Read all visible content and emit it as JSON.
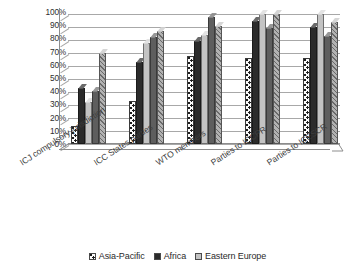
{
  "chart_data": {
    "type": "bar",
    "title": "",
    "subtitle": "",
    "xlabel": "",
    "ylabel": "",
    "ylim": [
      0,
      100
    ],
    "grid": true,
    "legend_position": "bottom",
    "y_ticks": [
      "0%",
      "10%",
      "20%",
      "30%",
      "40%",
      "50%",
      "60%",
      "70%",
      "80%",
      "90%",
      "100%"
    ],
    "y_tick_values": [
      0,
      10,
      20,
      30,
      40,
      50,
      60,
      70,
      80,
      90,
      100
    ],
    "categories": [
      "ICJ compulsory jurisdiction",
      "ICC States parties",
      "WTO members",
      "Parties to ICCPR",
      "Parties to ICESCR"
    ],
    "series": [
      {
        "name": "Asia-Pacific",
        "pattern": "dotted",
        "color": "#fbfbfb",
        "values": [
          14,
          33,
          68,
          66,
          66
        ]
      },
      {
        "name": "Africa",
        "pattern": "solid-dark",
        "color": "#2b2b2b",
        "values": [
          43,
          63,
          79,
          95,
          90
        ]
      },
      {
        "name": "Eastern Europe",
        "pattern": "solid-light",
        "color": "#c3c3c3",
        "values": [
          32,
          78,
          84,
          100,
          100
        ]
      },
      {
        "name": "",
        "pattern": "solid-grey",
        "color": "#5e5e5e",
        "values": [
          41,
          82,
          98,
          89,
          83
        ]
      },
      {
        "name": "",
        "pattern": "hatched",
        "color": "#b2b2b2",
        "values": [
          70,
          87,
          91,
          100,
          94
        ]
      }
    ]
  },
  "legend": {
    "items": [
      {
        "label": "Asia-Pacific",
        "swatch": "dotted-swatch"
      },
      {
        "label": "Africa",
        "swatch": "dark-swatch"
      },
      {
        "label": "Eastern Europe",
        "swatch": "light-grey-swatch"
      }
    ]
  }
}
